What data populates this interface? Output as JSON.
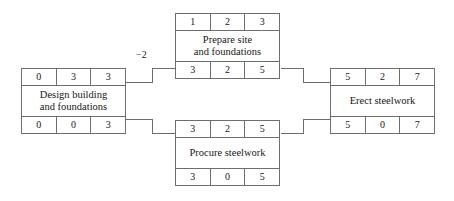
{
  "diagram": {
    "line_color": "#6e6e6e",
    "text_color": "#171717",
    "background": "#ffffff"
  },
  "nodes": [
    {
      "id": "design",
      "label": "Design building\nand foundations",
      "top_row": [
        "0",
        "3",
        "3"
      ],
      "bottom_row": [
        "0",
        "0",
        "3"
      ]
    },
    {
      "id": "prepare",
      "label": "Prepare site\nand foundations",
      "top_row": [
        "1",
        "2",
        "3"
      ],
      "bottom_row": [
        "3",
        "2",
        "5"
      ]
    },
    {
      "id": "procure",
      "label": "Procure steelwork",
      "top_row": [
        "3",
        "2",
        "5"
      ],
      "bottom_row": [
        "3",
        "0",
        "5"
      ]
    },
    {
      "id": "erect",
      "label": "Erect steelwork",
      "top_row": [
        "5",
        "2",
        "7"
      ],
      "bottom_row": [
        "5",
        "0",
        "7"
      ]
    }
  ],
  "edge_labels": [
    {
      "id": "design-to-prepare-lag",
      "text": "−2"
    }
  ]
}
